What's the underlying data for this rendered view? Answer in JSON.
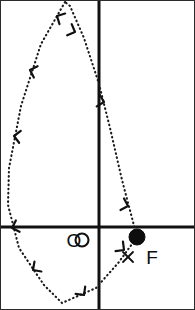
{
  "figure": {
    "background_color": "#ffffff",
    "frame_color": "#2b2b2b",
    "width": 195,
    "height": 310
  },
  "axes": {
    "color": "#111111",
    "stroke_width": 3,
    "horizontal": {
      "name": "horizontal-axis",
      "y": 227,
      "x_start": 1,
      "x_end": 194
    },
    "vertical": {
      "name": "vertical-axis",
      "x": 99,
      "y_start": 1,
      "y_end": 309
    }
  },
  "labels": {
    "origin": "O",
    "focus": "F"
  },
  "markers": {
    "origin_point": {
      "name": "origin-marker",
      "cx": 82,
      "cy": 240,
      "r": 6.5,
      "style": "open-circle"
    },
    "focus_point": {
      "name": "focus-marker",
      "cx": 137,
      "cy": 237,
      "r": 8,
      "style": "filled-dot"
    },
    "x_point": {
      "name": "x-marker",
      "cx": 128,
      "cy": 257,
      "size": 5,
      "style": "cross"
    }
  },
  "orbit": {
    "name": "orbit-path",
    "style": "dotted",
    "color": "#1a1a1a",
    "direction": "clockwise",
    "path": "M 65 2 L 41 44 L 21 106 L 9 168 L 8 205 L 19 248 L 44 285 L 62 303 L 96 288 L 119 262 L 137 237 L 122 180 L 110 128 L 99 84 L 84 38 L 70 6 Z",
    "description": "closed dotted elliptical orbit with apex at top and focus at F"
  },
  "arrows": [
    {
      "name": "arrow-head-1",
      "x": 57,
      "y": 16,
      "angle": 118
    },
    {
      "name": "arrow-head-2",
      "x": 30,
      "y": 70,
      "angle": 108
    },
    {
      "name": "arrow-head-3",
      "x": 14,
      "y": 136,
      "angle": 98
    },
    {
      "name": "arrow-head-4",
      "x": 12,
      "y": 228,
      "angle": 72
    },
    {
      "name": "arrow-head-5",
      "x": 33,
      "y": 270,
      "angle": 55
    },
    {
      "name": "arrow-head-6",
      "x": 84,
      "y": 295,
      "angle": -37
    },
    {
      "name": "arrow-head-7",
      "x": 124,
      "y": 250,
      "angle": -52
    },
    {
      "name": "arrow-head-8",
      "x": 128,
      "y": 206,
      "angle": -73
    },
    {
      "name": "arrow-head-9",
      "x": 104,
      "y": 102,
      "angle": -76
    },
    {
      "name": "arrow-head-10",
      "x": 75,
      "y": 32,
      "angle": -68
    }
  ]
}
